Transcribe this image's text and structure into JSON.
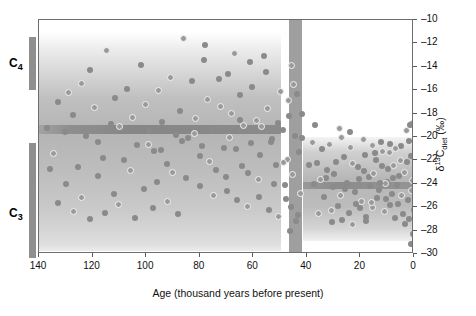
{
  "chart_data": {
    "type": "scatter",
    "title": "",
    "xlabel": "Age (thousand years before present)",
    "ylabel": "δ¹³C_diet (‰)",
    "xlim": [
      140,
      0
    ],
    "ylim": [
      -30,
      -10
    ],
    "x_ticks": [
      140,
      120,
      100,
      80,
      60,
      40,
      20,
      0
    ],
    "y_ticks": [
      -10,
      -12,
      -14,
      -16,
      -18,
      -20,
      -22,
      -24,
      -26,
      -28,
      -30
    ],
    "x_direction": "reversed",
    "grid": false,
    "legend": null,
    "annotations": [
      {
        "label": "C4",
        "type": "side-bracket",
        "y_range": [
          -12.0,
          -16.5
        ]
      },
      {
        "label": "C3",
        "type": "side-bracket",
        "y_range": [
          -20.8,
          -30.0
        ]
      }
    ],
    "shaded_regions": [
      {
        "name": "left-density-block",
        "x_range": [
          140,
          50
        ],
        "y_range": [
          -11.0,
          -27.5
        ]
      },
      {
        "name": "left-dark-stripe",
        "x_range": [
          140,
          50
        ],
        "y_range": [
          -18.6,
          -19.4
        ]
      },
      {
        "name": "vertical-dark-band",
        "x_range": [
          47,
          42
        ],
        "y_range": [
          -10.0,
          -30.0
        ]
      },
      {
        "name": "right-density-block",
        "x_range": [
          35,
          0
        ],
        "y_range": [
          -20.0,
          -28.9
        ]
      },
      {
        "name": "right-dark-stripe",
        "x_range": [
          35,
          0
        ],
        "y_range": [
          -23.8,
          -24.4
        ]
      }
    ],
    "series": [
      {
        "name": "δ¹³C diet samples",
        "marker": "circle",
        "points": [
          [
            137.0,
            -19.2
          ],
          [
            134.5,
            -21.4
          ],
          [
            132.8,
            -17.0
          ],
          [
            130.3,
            -19.6
          ],
          [
            129.0,
            -16.2
          ],
          [
            127.4,
            -18.1
          ],
          [
            125.6,
            -22.6
          ],
          [
            124.0,
            -15.4
          ],
          [
            122.5,
            -19.9
          ],
          [
            121.0,
            -14.3
          ],
          [
            119.4,
            -17.5
          ],
          [
            118.0,
            -20.4
          ],
          [
            116.3,
            -21.8
          ],
          [
            115.0,
            -12.6
          ],
          [
            113.2,
            -18.9
          ],
          [
            111.8,
            -16.7
          ],
          [
            110.0,
            -19.1
          ],
          [
            108.4,
            -22.0
          ],
          [
            107.0,
            -15.9
          ],
          [
            105.2,
            -18.3
          ],
          [
            103.6,
            -20.7
          ],
          [
            102.0,
            -13.8
          ],
          [
            100.3,
            -17.2
          ],
          [
            98.8,
            -19.5
          ],
          [
            97.0,
            -21.2
          ],
          [
            95.4,
            -16.0
          ],
          [
            94.0,
            -18.7
          ],
          [
            92.3,
            -22.3
          ],
          [
            90.8,
            -14.9
          ],
          [
            89.0,
            -19.8
          ],
          [
            87.5,
            -17.8
          ],
          [
            86.0,
            -11.6
          ],
          [
            84.4,
            -20.1
          ],
          [
            83.0,
            -15.2
          ],
          [
            81.5,
            -18.4
          ],
          [
            80.0,
            -21.6
          ],
          [
            78.6,
            -13.4
          ],
          [
            77.0,
            -16.8
          ],
          [
            75.5,
            -19.3
          ],
          [
            74.0,
            -22.8
          ],
          [
            72.4,
            -17.4
          ],
          [
            71.0,
            -20.9
          ],
          [
            69.6,
            -14.6
          ],
          [
            68.0,
            -18.0
          ],
          [
            66.5,
            -21.0
          ],
          [
            65.0,
            -16.4
          ],
          [
            63.6,
            -19.0
          ],
          [
            62.0,
            -23.1
          ],
          [
            60.5,
            -15.7
          ],
          [
            59.0,
            -18.6
          ],
          [
            57.4,
            -21.5
          ],
          [
            56.0,
            -13.1
          ],
          [
            54.6,
            -17.6
          ],
          [
            53.0,
            -20.2
          ],
          [
            51.5,
            -22.4
          ],
          [
            50.0,
            -16.1
          ],
          [
            49.0,
            -19.4
          ],
          [
            48.2,
            -24.1
          ],
          [
            47.4,
            -21.9
          ],
          [
            46.6,
            -18.2
          ],
          [
            78.0,
            -12.1
          ],
          [
            76.2,
            -22.1
          ],
          [
            73.0,
            -15.0
          ],
          [
            70.2,
            -23.4
          ],
          [
            67.2,
            -12.9
          ],
          [
            64.2,
            -22.5
          ],
          [
            61.2,
            -13.6
          ],
          [
            58.2,
            -23.6
          ],
          [
            55.2,
            -14.4
          ],
          [
            52.2,
            -24.0
          ],
          [
            90.0,
            -23.0
          ],
          [
            85.0,
            -23.5
          ],
          [
            80.0,
            -24.2
          ],
          [
            75.0,
            -25.0
          ],
          [
            70.0,
            -24.6
          ],
          [
            66.0,
            -25.4
          ],
          [
            62.0,
            -25.9
          ],
          [
            58.0,
            -25.1
          ],
          [
            54.0,
            -26.2
          ],
          [
            50.5,
            -26.8
          ],
          [
            96.0,
            -23.8
          ],
          [
            101.0,
            -24.4
          ],
          [
            106.0,
            -22.9
          ],
          [
            112.0,
            -24.9
          ],
          [
            118.0,
            -23.3
          ],
          [
            124.0,
            -25.2
          ],
          [
            130.0,
            -24.0
          ],
          [
            136.0,
            -22.7
          ],
          [
            127.0,
            -26.4
          ],
          [
            133.0,
            -25.6
          ],
          [
            88.0,
            -26.6
          ],
          [
            92.0,
            -25.5
          ],
          [
            97.5,
            -26.1
          ],
          [
            104.0,
            -26.9
          ],
          [
            110.5,
            -25.8
          ],
          [
            115.5,
            -26.5
          ],
          [
            121.0,
            -27.0
          ],
          [
            99.0,
            -20.6
          ],
          [
            94.5,
            -21.1
          ],
          [
            86.5,
            -20.3
          ],
          [
            82.0,
            -19.7
          ],
          [
            79.0,
            -20.8
          ],
          [
            71.8,
            -19.2
          ],
          [
            68.8,
            -20.0
          ],
          [
            64.8,
            -18.5
          ],
          [
            60.8,
            -20.5
          ],
          [
            57.0,
            -19.1
          ],
          [
            53.5,
            -20.4
          ],
          [
            50.8,
            -18.8
          ],
          [
            48.8,
            -22.2
          ],
          [
            47.8,
            -25.3
          ],
          [
            46.0,
            -26.0
          ],
          [
            45.2,
            -23.2
          ],
          [
            44.4,
            -19.9
          ],
          [
            43.6,
            -16.3
          ],
          [
            45.8,
            -13.9
          ],
          [
            44.0,
            -27.2
          ],
          [
            43.0,
            -21.3
          ],
          [
            42.4,
            -24.8
          ],
          [
            41.8,
            -18.0
          ],
          [
            46.2,
            -28.0
          ],
          [
            45.0,
            -15.5
          ],
          [
            43.4,
            -26.7
          ],
          [
            42.0,
            -20.1
          ],
          [
            47.0,
            -16.9
          ],
          [
            34.2,
            -21.0
          ],
          [
            33.0,
            -23.5
          ],
          [
            31.6,
            -20.6
          ],
          [
            30.2,
            -24.3
          ],
          [
            29.0,
            -22.1
          ],
          [
            27.6,
            -25.0
          ],
          [
            26.2,
            -21.7
          ],
          [
            25.0,
            -23.9
          ],
          [
            23.6,
            -20.9
          ],
          [
            22.2,
            -24.7
          ],
          [
            21.0,
            -22.6
          ],
          [
            19.6,
            -25.5
          ],
          [
            18.2,
            -21.5
          ],
          [
            17.0,
            -23.4
          ],
          [
            15.6,
            -26.0
          ],
          [
            14.2,
            -22.0
          ],
          [
            13.0,
            -24.5
          ],
          [
            11.6,
            -21.2
          ],
          [
            10.2,
            -23.8
          ],
          [
            9.0,
            -25.8
          ],
          [
            7.6,
            -22.4
          ],
          [
            6.2,
            -24.1
          ],
          [
            5.0,
            -20.8
          ],
          [
            3.6,
            -23.0
          ],
          [
            2.2,
            -25.4
          ],
          [
            1.2,
            -21.6
          ],
          [
            0.6,
            -23.7
          ],
          [
            0.2,
            -26.2
          ],
          [
            1.8,
            -27.0
          ],
          [
            3.0,
            -19.4
          ],
          [
            4.2,
            -26.6
          ],
          [
            5.6,
            -23.3
          ],
          [
            6.8,
            -21.0
          ],
          [
            8.2,
            -24.9
          ],
          [
            9.6,
            -22.7
          ],
          [
            11.0,
            -26.4
          ],
          [
            12.4,
            -20.4
          ],
          [
            13.8,
            -25.2
          ],
          [
            15.0,
            -23.1
          ],
          [
            16.4,
            -24.2
          ],
          [
            17.8,
            -26.8
          ],
          [
            19.0,
            -20.2
          ],
          [
            20.4,
            -23.6
          ],
          [
            21.8,
            -25.7
          ],
          [
            23.0,
            -22.3
          ],
          [
            24.4,
            -26.5
          ],
          [
            25.8,
            -24.4
          ],
          [
            27.0,
            -20.0
          ],
          [
            28.4,
            -25.9
          ],
          [
            29.8,
            -23.2
          ],
          [
            31.0,
            -26.3
          ],
          [
            32.4,
            -22.8
          ],
          [
            33.8,
            -25.1
          ],
          [
            35.0,
            -23.6
          ],
          [
            36.2,
            -22.2
          ],
          [
            2.6,
            -22.1
          ],
          [
            4.8,
            -25.0
          ],
          [
            7.0,
            -26.9
          ],
          [
            8.8,
            -20.6
          ],
          [
            10.8,
            -24.0
          ],
          [
            12.0,
            -22.5
          ],
          [
            14.6,
            -21.4
          ],
          [
            16.0,
            -25.6
          ],
          [
            18.6,
            -22.9
          ],
          [
            20.0,
            -26.1
          ],
          [
            0.9,
            -24.6
          ],
          [
            2.0,
            -20.3
          ],
          [
            3.4,
            -27.4
          ],
          [
            5.2,
            -22.0
          ],
          [
            6.0,
            -25.7
          ],
          [
            8.0,
            -23.5
          ],
          [
            9.2,
            -21.3
          ],
          [
            10.6,
            -25.3
          ],
          [
            12.8,
            -23.9
          ],
          [
            15.4,
            -20.7
          ],
          [
            0.4,
            -28.3
          ],
          [
            1.0,
            -29.1
          ],
          [
            0.8,
            -18.8
          ],
          [
            1.6,
            -19.0
          ],
          [
            24.0,
            -19.6
          ],
          [
            28.0,
            -19.3
          ],
          [
            30.8,
            -27.3
          ],
          [
            26.8,
            -27.1
          ],
          [
            22.8,
            -27.5
          ],
          [
            18.0,
            -27.2
          ],
          [
            36.8,
            -19.0
          ],
          [
            38.0,
            -20.5
          ],
          [
            39.2,
            -22.4
          ],
          [
            37.4,
            -24.0
          ],
          [
            35.6,
            -26.5
          ]
        ]
      }
    ]
  },
  "axes": {
    "x_tick_labels": [
      "140",
      "120",
      "100",
      "80",
      "60",
      "40",
      "20",
      "0"
    ],
    "y_tick_labels": [
      "–10",
      "–12",
      "–14",
      "–16",
      "–18",
      "–20",
      "–22",
      "–24",
      "–26",
      "–28",
      "–30"
    ],
    "x_title": "Age (thousand years before present)",
    "y_title_prefix": "δ",
    "y_title_sup": "13",
    "y_title_mid": "C",
    "y_title_sub": "diet",
    "y_title_unit": " (‰)"
  },
  "side_markers": [
    {
      "name": "c4-marker",
      "label_main": "C",
      "label_sub": "4"
    },
    {
      "name": "c3-marker",
      "label_main": "C",
      "label_sub": "3"
    }
  ],
  "colors": {
    "point_fill": "#8a8a8a",
    "point_ring": "#f2f2f2",
    "frame": "#6e6e6e",
    "marker_bar": "#8f8f8f",
    "text": "#111111"
  }
}
